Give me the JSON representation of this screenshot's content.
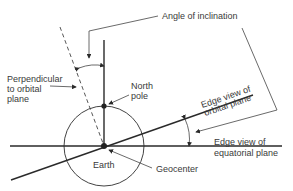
{
  "labels": {
    "angle_of_inclination": "Angle of inclination",
    "perpendicular_line1": "Perpendicular",
    "perpendicular_line2": "to orbital",
    "perpendicular_line3": "plane",
    "north_pole_line1": "North",
    "north_pole_line2": "pole",
    "orbital_plane_line1": "Edge view of",
    "orbital_plane_line2": "orbital plane",
    "equatorial_plane_line1": "Edge view of",
    "equatorial_plane_line2": "equatorial plane",
    "earth": "Earth",
    "geocenter": "Geocenter"
  },
  "colors": {
    "line": "#2a2a2a",
    "text": "#3a3a3a",
    "background": "#ffffff"
  }
}
